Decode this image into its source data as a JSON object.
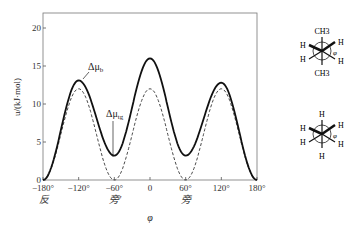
{
  "chart_data": {
    "type": "line",
    "title": "",
    "xlabel": "φ",
    "ylabel": "u/(kJ·mol)",
    "xlim": [
      -180,
      180
    ],
    "ylim": [
      0,
      22
    ],
    "x_ticks": [
      "-180°",
      "-120°",
      "-60°",
      "0",
      "60°",
      "120°",
      "180°"
    ],
    "x_sublabels": {
      "-180": "反",
      "-60": "旁′",
      "60": "旁"
    },
    "y_ticks": [
      "0",
      "5",
      "10",
      "15",
      "20"
    ],
    "x": [
      -180,
      -120,
      -60,
      0,
      60,
      120,
      180
    ],
    "series": [
      {
        "name": "Δμb",
        "style": "solid",
        "values": [
          0,
          13.1,
          3.2,
          16,
          3.2,
          12.8,
          0
        ]
      },
      {
        "name": "Δμtg",
        "style": "dashed",
        "values": [
          0,
          12,
          0,
          12,
          0,
          12,
          0
        ]
      }
    ],
    "annotations": [
      "Δμb",
      "Δμtg"
    ],
    "grid": false
  },
  "labels": {
    "mu_b": "Δμ",
    "mu_b_sub": "b",
    "mu_tg": "Δμ",
    "mu_tg_sub": "tg",
    "phi": "φ",
    "anti": "反",
    "gauche_prime": "旁′",
    "gauche": "旁"
  },
  "newman1": {
    "top": "CH3",
    "bottom": "CH3",
    "left_top": "H",
    "left_bottom": "H",
    "right_top": "H",
    "right_bottom": "H",
    "angle": "φ"
  },
  "newman2": {
    "top": "H",
    "bottom": "H",
    "left_top": "H",
    "left_bottom": "H",
    "right_top": "H",
    "right_bottom": "H",
    "angle": "φ"
  }
}
